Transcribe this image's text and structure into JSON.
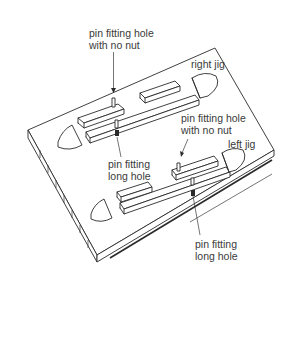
{
  "figure": {
    "stroke_color": "#2a2a2a",
    "text_color": "#3a3a3a",
    "background": "#ffffff"
  },
  "labels": {
    "top_pin_hole": {
      "line1": "pin fitting hole",
      "line2": "with no nut"
    },
    "right_jig": "right jig",
    "top_long_hole": {
      "line1": "pin fitting",
      "line2": "long hole"
    },
    "mid_pin_hole": {
      "line1": "pin fitting hole",
      "line2": "with no nut"
    },
    "left_jig": "left jig",
    "bottom_long_hole": {
      "line1": "pin fitting",
      "line2": "long hole"
    }
  }
}
